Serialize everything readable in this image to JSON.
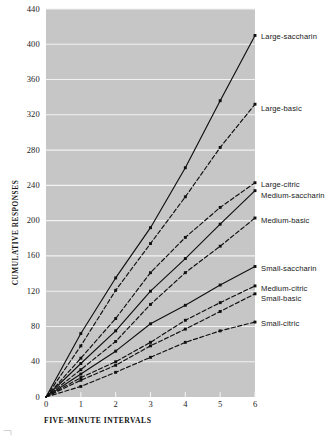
{
  "chart_data": {
    "type": "line",
    "title": "",
    "xlabel": "FIVE-MINUTE INTERVALS",
    "ylabel": "CUMULATIVE RESPONSES",
    "xlim": [
      0,
      6
    ],
    "ylim": [
      0,
      440
    ],
    "x": [
      0,
      1,
      2,
      3,
      4,
      5,
      6
    ],
    "xticks": [
      "0",
      "1",
      "2",
      "3",
      "4",
      "5",
      "6"
    ],
    "yticks": [
      "0",
      "40",
      "80",
      "120",
      "160",
      "200",
      "240",
      "280",
      "320",
      "360",
      "400",
      "440"
    ],
    "grid": "horizontal-white",
    "legend_position": "right-inline-at-line-end",
    "plot_background": "#c6c6c6",
    "line_color": "#101010",
    "marker": "square",
    "series": [
      {
        "name": "Large-saccharin",
        "style": "solid",
        "label_y": 36,
        "values": [
          0,
          72,
          135,
          192,
          260,
          336,
          410
        ]
      },
      {
        "name": "Large-basic",
        "style": "dashed",
        "label_y": 108,
        "values": [
          0,
          58,
          121,
          174,
          227,
          283,
          332
        ]
      },
      {
        "name": "Large-citric",
        "style": "dashed",
        "label_y": 184,
        "values": [
          0,
          44,
          89,
          141,
          181,
          215,
          243
        ]
      },
      {
        "name": "Medium-saccharin",
        "style": "solid",
        "label_y": 195,
        "values": [
          0,
          38,
          75,
          120,
          157,
          196,
          234
        ]
      },
      {
        "name": "Medium-basic",
        "style": "dashed",
        "label_y": 220,
        "values": [
          0,
          31,
          63,
          105,
          141,
          171,
          203
        ]
      },
      {
        "name": "Small-saccharin",
        "style": "solid",
        "label_y": 268,
        "values": [
          0,
          26,
          52,
          83,
          104,
          127,
          148
        ]
      },
      {
        "name": "Medium-citric",
        "style": "dashed",
        "label_y": 288,
        "values": [
          0,
          22,
          40,
          62,
          87,
          107,
          126
        ]
      },
      {
        "name": "Small-basic",
        "style": "dashed",
        "label_y": 298,
        "values": [
          0,
          19,
          36,
          58,
          77,
          97,
          117
        ]
      },
      {
        "name": "Small-citric",
        "style": "dashed",
        "label_y": 323,
        "values": [
          0,
          12,
          28,
          45,
          62,
          75,
          85
        ]
      }
    ]
  },
  "axes": {
    "y_title": "CUMULATIVE RESPONSES",
    "x_title": "FIVE-MINUTE INTERVALS"
  }
}
